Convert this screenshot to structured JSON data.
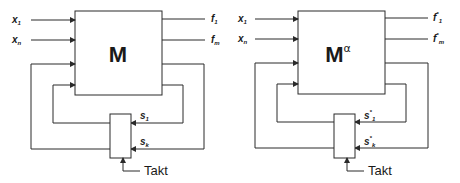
{
  "diagrams": [
    {
      "id": "left",
      "block_label": "M",
      "block_superscript": "",
      "inputs": [
        {
          "name": "x",
          "sub": "1"
        },
        {
          "name": "x",
          "sub": "n"
        }
      ],
      "outputs": [
        {
          "name": "f",
          "star": "",
          "sub": "1"
        },
        {
          "name": "f",
          "star": "",
          "sub": "m"
        }
      ],
      "states": [
        {
          "name": "s",
          "star": "",
          "sub": "1"
        },
        {
          "name": "s",
          "star": "",
          "sub": "k"
        }
      ],
      "clock_label": "Takt"
    },
    {
      "id": "right",
      "block_label": "M",
      "block_superscript": "α",
      "inputs": [
        {
          "name": "x",
          "sub": "1"
        },
        {
          "name": "x",
          "sub": "n"
        }
      ],
      "outputs": [
        {
          "name": "f",
          "star": "*",
          "sub": "1"
        },
        {
          "name": "f",
          "star": "*",
          "sub": "m"
        }
      ],
      "states": [
        {
          "name": "s",
          "star": "*",
          "sub": "1"
        },
        {
          "name": "s",
          "star": "*",
          "sub": "k"
        }
      ],
      "clock_label": "Takt"
    }
  ],
  "colors": {
    "line": "#2a2a2a",
    "text": "#1a1a1a",
    "background": "#ffffff"
  }
}
